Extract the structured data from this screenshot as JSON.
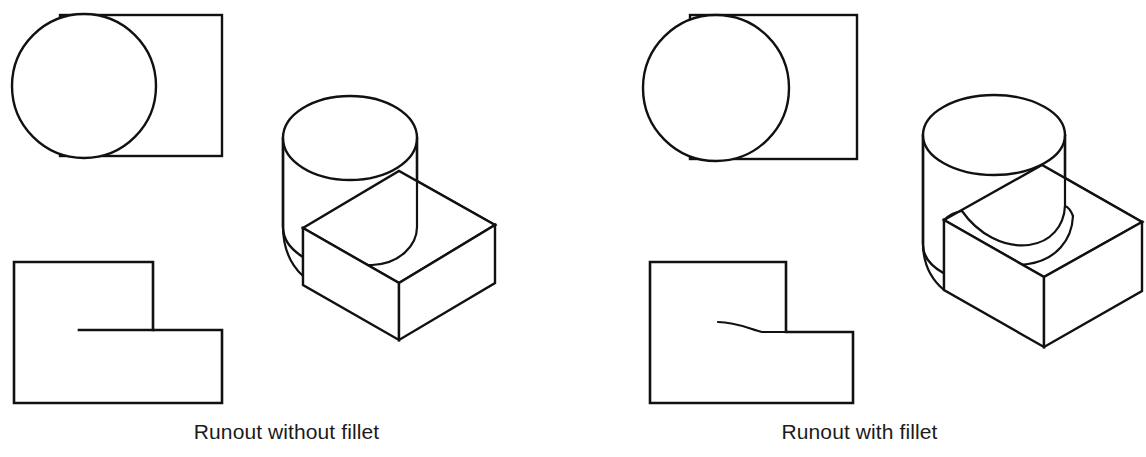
{
  "figure": {
    "background_color": "#ffffff",
    "line_color": "#111111",
    "width": 1146,
    "height": 457
  },
  "panels": [
    {
      "id": "left",
      "caption": "Runout without fillet",
      "description": "Orthographic top view, front view and isometric pictorial of a cylinder on a rectangular base with no fillet; the runout appears as a straight line in the front view.",
      "views": {
        "top_view": {
          "name": "top-view",
          "rectangle": {
            "x": 60,
            "y": 15,
            "width": 162,
            "height": 141
          },
          "circle": {
            "cx": 84,
            "cy": 86,
            "r": 72
          }
        },
        "front_view": {
          "name": "front-view",
          "outline": "L-shaped stepped profile",
          "runout_line": "straight",
          "rect": {
            "x": 14,
            "y": 262,
            "width": 208,
            "height": 141
          },
          "step_vertical_x": 153,
          "step_horizontal_y": 330,
          "runout_start_x": 79
        },
        "isometric": {
          "name": "isometric-view",
          "cylinder_top_center": {
            "cx": 350,
            "cy": 138
          },
          "cylinder_rx": 67,
          "cylinder_ry": 42,
          "has_fillet": false
        }
      }
    },
    {
      "id": "right",
      "caption": "Runout with fillet",
      "description": "Orthographic top view, front view and isometric pictorial of a cylinder blended into a rectangular base with a fillet; the runout appears as a curved line in the front view.",
      "views": {
        "top_view": {
          "name": "top-view",
          "rectangle": {
            "x": 690,
            "y": 15,
            "width": 167,
            "height": 144
          },
          "circle": {
            "cx": 716,
            "cy": 88,
            "r": 73
          }
        },
        "front_view": {
          "name": "front-view",
          "outline": "L-shaped stepped profile",
          "runout_line": "curved",
          "rect": {
            "x": 650,
            "y": 262,
            "width": 203,
            "height": 141
          },
          "step_vertical_x": 786,
          "step_horizontal_y": 332,
          "runout_start_x": 718,
          "runout_start_y": 322
        },
        "isometric": {
          "name": "isometric-view",
          "cylinder_top_center": {
            "cx": 994,
            "cy": 135
          },
          "cylinder_rx": 71,
          "cylinder_ry": 40,
          "has_fillet": true
        }
      }
    }
  ]
}
